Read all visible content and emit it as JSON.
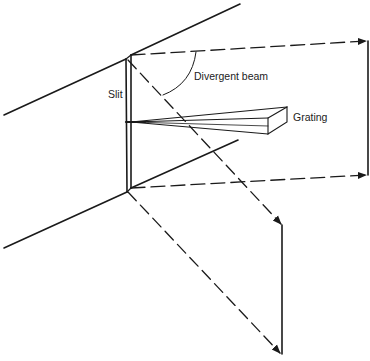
{
  "diagram": {
    "labels": {
      "slit": "Slit",
      "divergent_beam": "Divergent beam",
      "grating": "Grating"
    },
    "colors": {
      "line": "#1a1a1a",
      "background": "#ffffff"
    }
  }
}
